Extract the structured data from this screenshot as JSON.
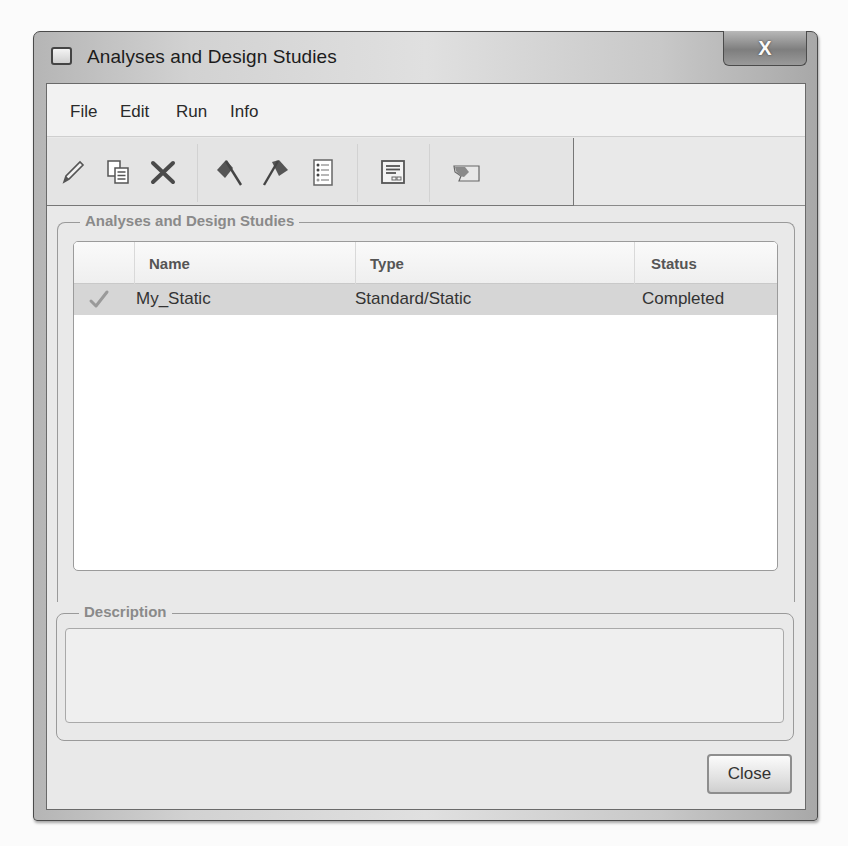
{
  "window": {
    "title": "Analyses and Design Studies",
    "close_glyph": "X"
  },
  "menu": {
    "items": [
      {
        "label": "File"
      },
      {
        "label": "Edit"
      },
      {
        "label": "Run"
      },
      {
        "label": "Info"
      }
    ]
  },
  "toolbar": {
    "buttons": [
      {
        "icon": "pencil-icon",
        "action": "edit"
      },
      {
        "icon": "copy-icon",
        "action": "copy"
      },
      {
        "icon": "delete-icon",
        "action": "delete"
      },
      {
        "icon": "start-flag-icon",
        "action": "start"
      },
      {
        "icon": "stop-flag-icon",
        "action": "stop"
      },
      {
        "icon": "checklist-icon",
        "action": "status"
      },
      {
        "icon": "review-window-icon",
        "action": "review"
      },
      {
        "icon": "results-icon",
        "action": "results"
      }
    ]
  },
  "analyses_group": {
    "label": "Analyses and Design Studies",
    "columns": [
      {
        "label": ""
      },
      {
        "label": "Name"
      },
      {
        "label": "Type"
      },
      {
        "label": "Status"
      }
    ],
    "rows": [
      {
        "checked": true,
        "name": "My_Static",
        "type": "Standard/Static",
        "status": "Completed"
      }
    ]
  },
  "description_group": {
    "label": "Description",
    "value": ""
  },
  "buttons": {
    "close_label": "Close"
  },
  "colors": {
    "selected_row": "#d6d6d6",
    "group_label": "#8a8a8a",
    "window_frame": "#4a4a4a"
  }
}
